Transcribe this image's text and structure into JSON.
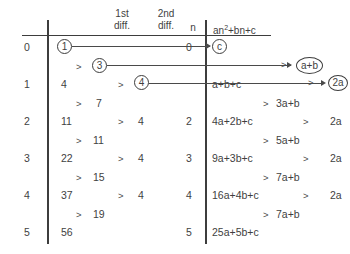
{
  "diagram": {
    "ink_color": "#3d3d3d",
    "background": "#ffffff"
  },
  "left_table": {
    "headers": {
      "n_col": "",
      "value_col": "",
      "first_diff_line1": "1st",
      "first_diff_line2": "diff.",
      "second_diff_line1": "2nd",
      "second_diff_line2": "diff."
    },
    "n_values": [
      "0",
      "1",
      "2",
      "3",
      "4",
      "5"
    ],
    "sequence_values": [
      "1",
      "4",
      "11",
      "22",
      "37",
      "56"
    ],
    "first_differences": [
      "3",
      "7",
      "11",
      "15",
      "19"
    ],
    "second_differences": [
      "4",
      "4",
      "4",
      "4"
    ],
    "circled": {
      "first_term": "1",
      "first_difference": "3",
      "second_difference": "4"
    },
    "comparators": [
      ">",
      ">",
      ">",
      ">",
      ">",
      ">",
      ">",
      ">",
      ">"
    ]
  },
  "right_table": {
    "headers": {
      "n_col": "n",
      "expr_col_prefix": "an",
      "expr_col_exponent": "2",
      "expr_col_suffix": "+bn+c"
    },
    "n_values": [
      "0",
      "2",
      "3",
      "4",
      "5"
    ],
    "expressions": [
      "c",
      "a+b+c",
      "4a+2b+c",
      "9a+3b+c",
      "16a+4b+c",
      "25a+5b+c"
    ],
    "first_differences": [
      "a+b",
      "3a+b",
      "5a+b",
      "7a+b",
      "7a+b"
    ],
    "second_differences": [
      "2a",
      "2a",
      "2a",
      "2a"
    ],
    "circled": {
      "first_term": "c",
      "first_difference": "a+b",
      "second_difference": "2a"
    },
    "comparators": [
      ">",
      ">",
      ">",
      ">",
      ">",
      ">",
      ">",
      ">"
    ]
  },
  "mappings": [
    {
      "from": "1",
      "to": "c",
      "label": "constant-term-mapping"
    },
    {
      "from": "3",
      "to": "a+b",
      "label": "first-difference-mapping"
    },
    {
      "from": "4",
      "to": "2a",
      "label": "second-difference-mapping"
    }
  ]
}
